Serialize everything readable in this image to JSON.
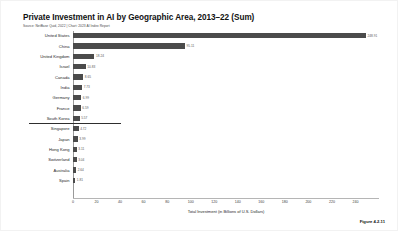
{
  "chart_data": {
    "type": "bar",
    "orientation": "horizontal",
    "title": "Private Investment in AI by Geographic Area, 2013–22 (Sum)",
    "source": "Source: NetBase Quid, 2022 | Chart: 2023 AI Index Report",
    "xlabel": "Total Investment (in Billions of U.S. Dollars)",
    "ylabel": "",
    "xlim": [
      0,
      260
    ],
    "xticks": [
      0,
      20,
      40,
      60,
      80,
      100,
      120,
      140,
      160,
      180,
      200,
      220,
      240
    ],
    "grid": false,
    "legend": false,
    "bar_color": "#4b4b4b",
    "figure_number": "Figure 4.2.11",
    "categories": [
      "United States",
      "China",
      "United Kingdom",
      "Israel",
      "Canada",
      "India",
      "Germany",
      "France",
      "South Korea",
      "Singapore",
      "Japan",
      "Hong Kong",
      "Switzerland",
      "Australia",
      "Spain"
    ],
    "values": [
      248.9,
      95.1,
      18.24,
      10.83,
      8.65,
      7.73,
      6.99,
      6.59,
      5.57,
      4.72,
      3.99,
      3.11,
      3.04,
      2.64,
      1.81
    ],
    "value_labels": [
      "248.91",
      "95.11",
      "18.24",
      "10.83",
      "8.65",
      "7.73",
      "6.99",
      "6.59",
      "5.57",
      "4.72",
      "3.99",
      "3.11",
      "3.04",
      "2.64",
      "1.81"
    ],
    "separator_after_category": "South Korea"
  }
}
